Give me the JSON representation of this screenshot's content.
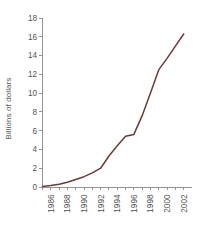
{
  "chart_data": {
    "type": "line",
    "title": "",
    "subtitle": "",
    "xlabel": "",
    "ylabel": "Billions of dollars",
    "xlim": [
      1985,
      2003
    ],
    "ylim": [
      0,
      18
    ],
    "ytick_step": 2,
    "xtick_step_minor": 1,
    "xtick_step_major": 2,
    "grid": false,
    "legend": false,
    "legend_position": "none",
    "line_color": "#6b3b3b",
    "axis_color": "#8a8a8a",
    "text_color": "#555555",
    "y_ticks": [
      0,
      2,
      4,
      6,
      8,
      10,
      12,
      14,
      16,
      18
    ],
    "y_tick_labels": [
      "0",
      "2",
      "4",
      "6",
      "8",
      "10",
      "12",
      "14",
      "16",
      "18"
    ],
    "x_ticks_all": [
      1985,
      1986,
      1987,
      1988,
      1989,
      1990,
      1991,
      1992,
      1993,
      1994,
      1995,
      1996,
      1997,
      1998,
      1999,
      2000,
      2001,
      2002
    ],
    "x_tick_labels": [
      "1986",
      "1988",
      "1990",
      "1992",
      "1994",
      "1996",
      "1998",
      "2000",
      "2002"
    ],
    "x_tick_label_years": [
      1986,
      1988,
      1990,
      1992,
      1994,
      1996,
      1998,
      2000,
      2002
    ],
    "x": [
      1985,
      1986,
      1987,
      1988,
      1989,
      1990,
      1991,
      1992,
      1993,
      1994,
      1995,
      1996,
      1997,
      1998,
      1999,
      2000,
      2001,
      2002
    ],
    "values": [
      0.05,
      0.15,
      0.3,
      0.5,
      0.8,
      1.1,
      1.5,
      2.0,
      3.3,
      4.4,
      5.4,
      5.6,
      7.6,
      10.0,
      12.5,
      13.7,
      15.0,
      16.3
    ],
    "series": [
      {
        "name": "Billions of dollars",
        "color": "#6b3b3b",
        "values": [
          0.05,
          0.15,
          0.3,
          0.5,
          0.8,
          1.1,
          1.5,
          2.0,
          3.3,
          4.4,
          5.4,
          5.6,
          7.6,
          10.0,
          12.5,
          13.7,
          15.0,
          16.3
        ]
      }
    ]
  }
}
